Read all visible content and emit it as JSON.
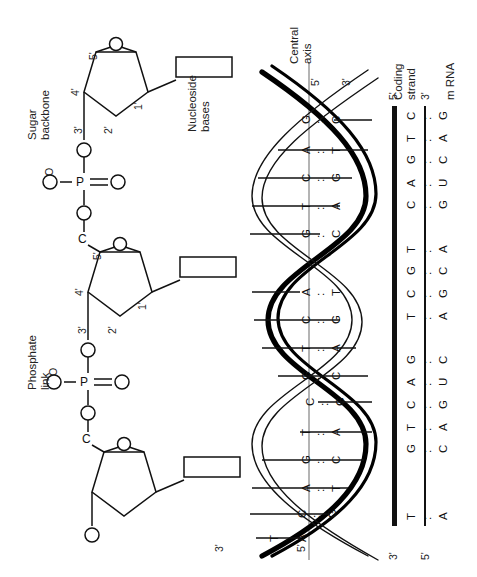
{
  "figure": {
    "orientation": "labels rotated 90 degrees counter-clockwise"
  },
  "labels": {
    "sugar_backbone": "Sugar\nbackbone",
    "nucleoside_bases": "Nucleoside\nbases",
    "phosphate_link": "Phosphate\nlink",
    "central_axis": "Central\naxis",
    "coding_strand": "Coding\nstrand",
    "mrna": "m RNA"
  },
  "chemistry": {
    "ring_positions": [
      "5'",
      "4'",
      "3'",
      "2'",
      "1'"
    ],
    "oxygen": "O",
    "oxygen_minus": "O",
    "phosphorus": "P",
    "carbon": "C",
    "minus": "–",
    "double_bond_o": "O"
  },
  "helix": {
    "top_end_labels": [
      "5'",
      "3'"
    ],
    "bottom_end_labels": [
      "3'",
      "5'"
    ],
    "base_pairs": [
      {
        "left": "C",
        "right": "G"
      },
      {
        "left": "T",
        "right": "A"
      },
      {
        "left": "G",
        "right": "C"
      },
      {
        "left": "A",
        "right": "T"
      },
      {
        "left": "C",
        "right": "G"
      },
      {
        "left": "T",
        "right": "A"
      },
      {
        "left": "G",
        "right": "C"
      },
      {
        "left": "A",
        "right": "T"
      },
      {
        "left": "C",
        "right": "G"
      },
      {
        "left": "G",
        "right": "C"
      },
      {
        "left": "A",
        "right": "T"
      },
      {
        "left": "C",
        "right": "G"
      },
      {
        "left": "T",
        "right": "A"
      },
      {
        "left": "G",
        "right": "C"
      },
      {
        "left": "A",
        "right": "T"
      }
    ],
    "pair_separator": ":"
  },
  "strands": {
    "coding": {
      "five_prime": "5'",
      "three_prime": "3'",
      "sequence": [
        "C",
        "T",
        "G",
        "A",
        "C",
        "",
        "T",
        "G",
        "C",
        "T",
        "",
        "G",
        "A",
        "C",
        "T",
        "G",
        "",
        "",
        "T"
      ]
    },
    "mrna": {
      "five_prime": "5'",
      "three_prime": "3'",
      "sequence": [
        "G",
        "A",
        "C",
        "U",
        "G",
        "",
        "A",
        "C",
        "G",
        "A",
        "",
        "C",
        "U",
        "G",
        "A",
        "C",
        "",
        "",
        "A"
      ]
    },
    "pair_marks": ":"
  },
  "colors": {
    "ink": "#111111",
    "axis": "#8c8c8c",
    "paper": "#ffffff"
  }
}
